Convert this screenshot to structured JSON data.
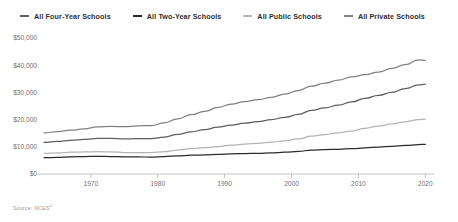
{
  "legend": {
    "items": [
      {
        "label": "All Four-Year Schools",
        "color": "#5f5f5f"
      },
      {
        "label": "All Two-Year Schools",
        "color": "#2b2b2b"
      },
      {
        "label": "All Public Schools",
        "color": "#b4b4b4"
      },
      {
        "label": "All Private Schools",
        "color": "#808080"
      }
    ]
  },
  "source": {
    "text": "Source: NCES",
    "superscript": "2"
  },
  "chart_data": {
    "type": "line",
    "title": "",
    "xlabel": "",
    "ylabel": "",
    "xlim": [
      1963,
      2021
    ],
    "ylim": [
      0,
      50000
    ],
    "grid": false,
    "legend_position": "top",
    "x_ticks": [
      1970,
      1980,
      1990,
      2000,
      2010,
      2020
    ],
    "x_tick_labels": [
      "1970",
      "1980",
      "1990",
      "2000",
      "2010",
      "2020"
    ],
    "y_ticks": [
      0,
      10000,
      20000,
      30000,
      40000,
      50000
    ],
    "y_tick_labels": [
      "$0",
      "$10,000",
      "$20,000",
      "$30,000",
      "$40,000",
      "$50,000"
    ],
    "x": [
      1963,
      1965,
      1967,
      1969,
      1971,
      1973,
      1975,
      1977,
      1979,
      1981,
      1983,
      1985,
      1987,
      1989,
      1991,
      1993,
      1995,
      1997,
      1999,
      2001,
      2003,
      2005,
      2007,
      2009,
      2011,
      2013,
      2015,
      2017,
      2019,
      2020
    ],
    "series": [
      {
        "name": "All Private Schools",
        "color": "#808080",
        "values": [
          15100,
          15600,
          16100,
          16600,
          17300,
          17500,
          17400,
          17700,
          17800,
          18800,
          20300,
          21800,
          23000,
          24500,
          25700,
          26600,
          27300,
          28200,
          29400,
          30700,
          32300,
          33400,
          34500,
          35700,
          36500,
          37500,
          38800,
          40200,
          42000,
          41800
        ]
      },
      {
        "name": "All Four-Year Schools",
        "color": "#5f5f5f",
        "values": [
          11600,
          12000,
          12400,
          12700,
          13100,
          13100,
          12900,
          13000,
          13000,
          13600,
          14600,
          15500,
          16300,
          17200,
          18000,
          18700,
          19300,
          20000,
          20800,
          21900,
          23400,
          24300,
          25300,
          26500,
          27800,
          28900,
          30000,
          31400,
          32800,
          33000
        ]
      },
      {
        "name": "All Public Schools",
        "color": "#b4b4b4",
        "values": [
          7600,
          7800,
          8000,
          8100,
          8200,
          8100,
          7900,
          7900,
          7900,
          8200,
          8800,
          9300,
          9700,
          10100,
          10600,
          11000,
          11300,
          11700,
          12200,
          12900,
          13900,
          14500,
          15100,
          15800,
          16800,
          17600,
          18400,
          19200,
          20000,
          20200
        ]
      },
      {
        "name": "All Two-Year Schools",
        "color": "#2b2b2b",
        "values": [
          6000,
          6100,
          6300,
          6400,
          6500,
          6400,
          6300,
          6300,
          6200,
          6400,
          6700,
          6900,
          7000,
          7200,
          7400,
          7500,
          7600,
          7800,
          8000,
          8300,
          8800,
          9000,
          9100,
          9300,
          9600,
          9900,
          10200,
          10500,
          10800,
          10900
        ]
      }
    ]
  }
}
